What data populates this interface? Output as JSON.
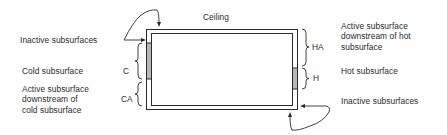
{
  "diagram": {
    "type": "room-surface-classification",
    "ceiling_label": "Ceiling",
    "left_labels": {
      "inactive_top": "Inactive subsurfaces",
      "cold": "Cold subsurface",
      "cold_active": [
        "Active subsurface",
        "downstream of",
        "cold subsurface"
      ]
    },
    "right_labels": {
      "hot_active": [
        "Active subsurface",
        "downstream of hot",
        "subsurface"
      ],
      "hot": "Hot subsurface",
      "inactive_bottom": "Inactive subsurfaces"
    },
    "segment_codes": {
      "C": "C",
      "CA": "CA",
      "HA": "HA",
      "H": "H"
    },
    "colors": {
      "line": "#2a2a2a",
      "shaded_subsurface": "#b8b8b8",
      "background": "#ffffff"
    }
  }
}
